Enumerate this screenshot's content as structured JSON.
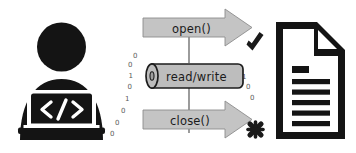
{
  "diagram": {
    "background_color": "#ffffff",
    "ink_color": "#141414",
    "arrow_fill": "#c4c4c4",
    "arrow_stroke": "#8d8d8d",
    "cylinder_fill": "#bdbdbd",
    "cylinder_stroke": "#1d1d1d",
    "connector_color": "#4a4a4a",
    "digit_color": "#5a5a5a"
  },
  "actor": {
    "name": "programmer",
    "screen_text": "</>"
  },
  "operations": {
    "open": {
      "label": "open()",
      "result_icon": "check-icon",
      "result_meaning": "success"
    },
    "read_write": {
      "label": "read/write"
    },
    "close": {
      "label": "close()",
      "result_icon": "cross-icon",
      "result_meaning": "terminated"
    }
  },
  "data_stream": {
    "left_digits": [
      "0",
      "0",
      "0",
      "1",
      "0",
      "1",
      "0",
      "0"
    ],
    "right_digits": [
      "1",
      "0",
      "0"
    ]
  },
  "file": {
    "name": "document",
    "line_count": 6
  }
}
